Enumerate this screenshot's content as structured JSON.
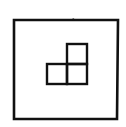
{
  "diagram": {
    "stroke_color": "#111111",
    "background_color": "#ffffff",
    "outer_square": {
      "x": 14,
      "y": 20,
      "width": 104,
      "height": 99
    },
    "small_squares": [
      {
        "name": "top-right",
        "x": 67,
        "y": 44,
        "size": 20
      },
      {
        "name": "bottom-left",
        "x": 47,
        "y": 64,
        "size": 20
      },
      {
        "name": "bottom-right",
        "x": 67,
        "y": 64,
        "size": 20
      }
    ],
    "tick_mark": {
      "x": 73,
      "y": 19
    }
  }
}
